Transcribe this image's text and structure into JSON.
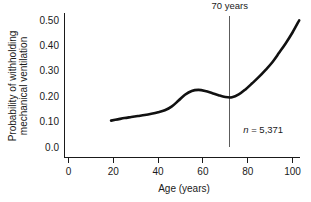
{
  "chart_data": {
    "type": "line",
    "title": "",
    "xlabel": "Age (years)",
    "ylabel_line1": "Probability of withholding",
    "ylabel_line2": "mechanical ventilation",
    "xlim": [
      0,
      104
    ],
    "ylim": [
      0.0,
      0.53
    ],
    "grid": false,
    "legend": false,
    "xticks": [
      0,
      20,
      40,
      60,
      80,
      100
    ],
    "xtick_labels": [
      "0",
      "20",
      "40",
      "60",
      "80",
      "100"
    ],
    "yticks": [
      0.0,
      0.1,
      0.2,
      0.3,
      0.4,
      0.5
    ],
    "ytick_labels": [
      "0.0",
      "0.10",
      "0.20",
      "0.30",
      "0.40",
      "0.50"
    ],
    "series": [
      {
        "name": "Probability of withholding mechanical ventilation",
        "color": "#111111",
        "x": [
          19,
          22,
          25,
          28,
          31,
          34,
          37,
          40,
          43,
          46,
          49,
          52,
          55,
          58,
          61,
          64,
          67,
          70,
          73,
          76,
          79,
          82,
          85,
          88,
          91,
          94,
          97,
          100,
          103
        ],
        "y": [
          0.105,
          0.11,
          0.115,
          0.119,
          0.123,
          0.127,
          0.132,
          0.138,
          0.146,
          0.16,
          0.183,
          0.207,
          0.222,
          0.226,
          0.222,
          0.214,
          0.205,
          0.198,
          0.197,
          0.208,
          0.228,
          0.252,
          0.277,
          0.305,
          0.335,
          0.372,
          0.41,
          0.452,
          0.5
        ]
      }
    ],
    "annotations": [
      {
        "name": "seventy-years-marker",
        "label": "70 years",
        "x": 72,
        "type": "vertical-line-with-label",
        "label_y": 0.545,
        "line_top_y": 0.515,
        "line_bottom_y": 0.0
      },
      {
        "name": "sample-size",
        "label_italic": "n",
        "label_rest": " = 5,371",
        "x": 78,
        "y": 0.055
      }
    ]
  },
  "colors": {
    "background": "#ffffff",
    "axis": "#1a1a1a",
    "series": "#111111",
    "annotation_line": "#4a4a4a",
    "text": "#1a1a1a"
  }
}
